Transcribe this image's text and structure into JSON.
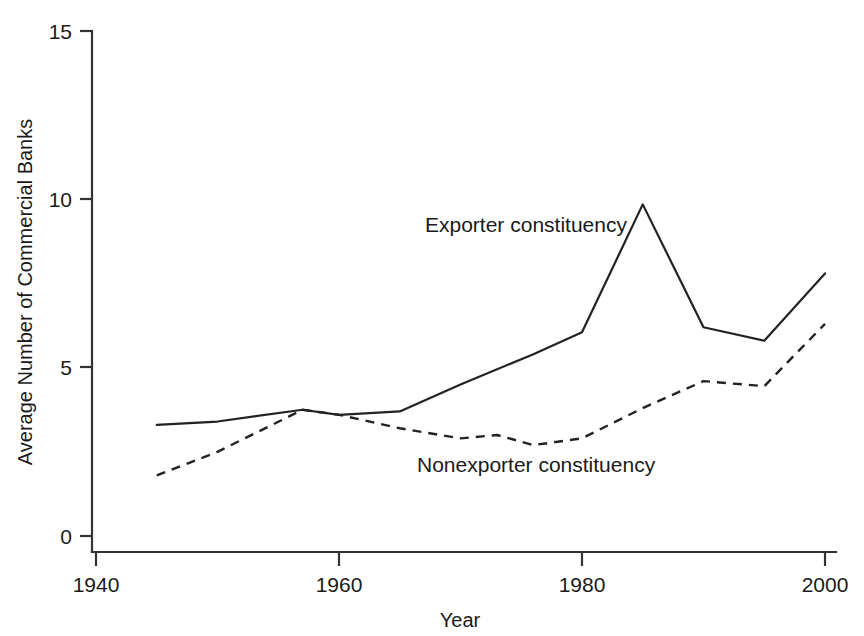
{
  "chart_data": {
    "type": "line",
    "title": "",
    "xlabel": "Year",
    "ylabel": "Average Number of Commercial Banks",
    "xlim": [
      1940,
      2000
    ],
    "ylim": [
      0,
      15
    ],
    "xticks": [
      1940,
      1960,
      1980,
      2000
    ],
    "yticks": [
      0,
      5,
      10,
      15
    ],
    "grid": false,
    "legend_position": "inline-annotation",
    "series": [
      {
        "name": "Exporter constituency",
        "style": "solid",
        "x": [
          1945,
          1950,
          1957,
          1960,
          1965,
          1970,
          1976,
          1980,
          1985,
          1990,
          1995,
          2000
        ],
        "values": [
          3.3,
          3.4,
          3.75,
          3.6,
          3.7,
          4.5,
          5.4,
          6.05,
          9.85,
          6.2,
          5.8,
          7.8
        ]
      },
      {
        "name": "Nonexporter constituency",
        "style": "dashed",
        "x": [
          1945,
          1950,
          1957,
          1960,
          1965,
          1970,
          1973,
          1976,
          1980,
          1985,
          1990,
          1995,
          2000
        ],
        "values": [
          1.8,
          2.5,
          3.75,
          3.6,
          3.2,
          2.9,
          3.0,
          2.7,
          2.9,
          3.8,
          4.6,
          4.45,
          6.3
        ]
      }
    ],
    "annotations": [
      {
        "text": "Exporter constituency",
        "x_px": 425,
        "y_px": 232
      },
      {
        "text": "Nonexporter constituency",
        "x_px": 417,
        "y_px": 472
      }
    ],
    "colors": {
      "line": "#222222",
      "axis": "#333333",
      "background": "#ffffff"
    }
  },
  "axis": {
    "y_tick_labels": [
      "15",
      "10",
      "5",
      "0"
    ],
    "x_tick_labels": [
      "1940",
      "1960",
      "1980",
      "2000"
    ],
    "x_title": "Year",
    "y_title": "Average Number of Commercial Banks"
  },
  "labels": {
    "exporter": "Exporter constituency",
    "nonexporter": "Nonexporter constituency"
  }
}
